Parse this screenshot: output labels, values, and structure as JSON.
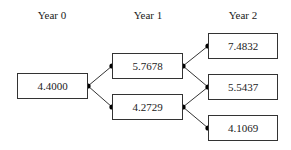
{
  "headers": [
    "Year 0",
    "Year 1",
    "Year 2"
  ],
  "nodes": {
    "y0": "4.4000",
    "y1_up": "5.7678",
    "y1_down": "4.2729",
    "y2_upup": "7.4832",
    "y2_mid": "5.5437",
    "y2_downdown": "4.1069"
  },
  "colors": {
    "line": "#333333",
    "dot": "#000000",
    "box_border": "#333333"
  }
}
